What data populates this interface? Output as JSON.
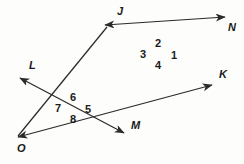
{
  "figure": {
    "background_color": "#fdfdfc",
    "stroke_color": "#2b2b2b",
    "text_color": "#1a1a1a",
    "width": 244,
    "height": 164,
    "intersections": [
      {
        "name": "upper-intersection",
        "x": 158,
        "y": 52
      },
      {
        "name": "lower-intersection",
        "x": 73,
        "y": 107
      }
    ],
    "lines": [
      {
        "name": "line-OK",
        "from_label": "O",
        "to_label": "K",
        "x1": 18,
        "y1": 137,
        "x2": 212,
        "y2": 85,
        "arrows": "both"
      },
      {
        "name": "line-LM",
        "from_label": "L",
        "to_label": "M",
        "x1": 20,
        "y1": 78,
        "x2": 124,
        "y2": 133,
        "arrows": "both"
      },
      {
        "name": "line-JN",
        "from_label": "J",
        "to_label": "N",
        "x1": 105,
        "y1": 25,
        "x2": 225,
        "y2": 17,
        "arrows": "both"
      }
    ],
    "ray_labels": [
      {
        "name": "label-J",
        "text": "J",
        "x": 117,
        "y": 6
      },
      {
        "name": "label-N",
        "text": "N",
        "x": 228,
        "y": 22
      },
      {
        "name": "label-L",
        "text": "L",
        "x": 29,
        "y": 60
      },
      {
        "name": "label-K",
        "text": "K",
        "x": 219,
        "y": 69
      },
      {
        "name": "label-M",
        "text": "M",
        "x": 131,
        "y": 120
      },
      {
        "name": "label-O",
        "text": "O",
        "x": 17,
        "y": 143
      }
    ],
    "angle_labels": [
      {
        "name": "angle-1",
        "text": "1",
        "x": 171,
        "y": 50
      },
      {
        "name": "angle-2",
        "text": "2",
        "x": 155,
        "y": 38
      },
      {
        "name": "angle-3",
        "text": "3",
        "x": 140,
        "y": 49
      },
      {
        "name": "angle-4",
        "text": "4",
        "x": 155,
        "y": 60
      },
      {
        "name": "angle-5",
        "text": "5",
        "x": 85,
        "y": 104
      },
      {
        "name": "angle-6",
        "text": "6",
        "x": 70,
        "y": 92
      },
      {
        "name": "angle-7",
        "text": "7",
        "x": 55,
        "y": 103
      },
      {
        "name": "angle-8",
        "text": "8",
        "x": 70,
        "y": 114
      }
    ]
  }
}
